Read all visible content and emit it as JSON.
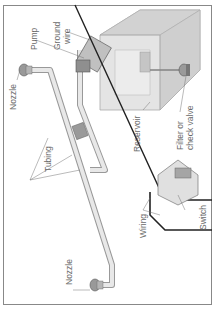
{
  "diagram": {
    "type": "windshield washer system",
    "orientation": "rotated 90 degrees counter-clockwise",
    "labels": {
      "pump": "Pump",
      "ground_wire": [
        "Ground",
        "wire"
      ],
      "nozzle_top": "Nozzle",
      "tubing": "Tubing",
      "reservoir": "Reservoir",
      "filter": [
        "Filter or",
        "check valve"
      ],
      "switch": "Switch",
      "wiring": "Wiring",
      "nozzle_bottom": "Nozzle"
    },
    "colors": {
      "frame": "#888888",
      "part_fill": "#dcdcdc",
      "part_dark": "#9a9a9a",
      "wire": "#222222",
      "label": "#6a6a6a"
    }
  }
}
